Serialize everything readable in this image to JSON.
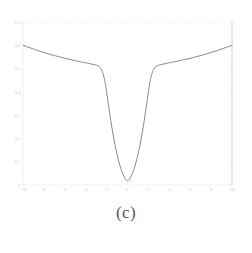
{
  "figure": {
    "caption": "(c)",
    "background_color": "#ffffff",
    "curve_color": "#6b6b6b",
    "axis_color": "#d8d8d8",
    "tick_label_color": "#c9c9c9"
  },
  "chart_data": {
    "type": "line",
    "title": "",
    "subtitle": "",
    "xlabel": "",
    "ylabel": "",
    "xlim": [
      -10,
      10
    ],
    "ylim": [
      0.0,
      0.7
    ],
    "grid": false,
    "legend": null,
    "legend_position": "none",
    "x_ticks": [
      -10,
      -8,
      -6,
      -4,
      -2,
      0,
      2,
      4,
      6,
      8,
      10
    ],
    "x_tick_labels": [
      "-10",
      "-8",
      "-6",
      "-4",
      "-2",
      "0",
      "2",
      "4",
      "6",
      "8",
      "10"
    ],
    "y_ticks": [
      0.0,
      0.1,
      0.2,
      0.3,
      0.4,
      0.5,
      0.6,
      0.7
    ],
    "y_tick_labels": [
      "0",
      "0.1",
      "0.2",
      "0.3",
      "0.4",
      "0.5",
      "0.6",
      "0.7"
    ],
    "series": [
      {
        "name": "curve",
        "x": [
          -10.0,
          -9.5,
          -9.0,
          -8.5,
          -8.0,
          -7.5,
          -7.0,
          -6.5,
          -6.0,
          -5.5,
          -5.0,
          -4.5,
          -4.0,
          -3.8,
          -3.6,
          -3.4,
          -3.2,
          -3.0,
          -2.9,
          -2.8,
          -2.7,
          -2.6,
          -2.5,
          -2.4,
          -2.3,
          -2.2,
          -2.1,
          -2.0,
          -1.8,
          -1.6,
          -1.4,
          -1.2,
          -1.0,
          -0.8,
          -0.6,
          -0.4,
          -0.2,
          0.0,
          0.2,
          0.4,
          0.6,
          0.8,
          1.0,
          1.2,
          1.4,
          1.6,
          1.8,
          2.0,
          2.1,
          2.2,
          2.3,
          2.4,
          2.5,
          2.6,
          2.7,
          2.8,
          2.9,
          3.0,
          3.2,
          3.4,
          3.6,
          3.8,
          4.0,
          4.5,
          5.0,
          5.5,
          6.0,
          6.5,
          7.0,
          7.5,
          8.0,
          8.5,
          9.0,
          9.5,
          10.0
        ],
        "y": [
          0.6,
          0.592,
          0.584,
          0.576,
          0.569,
          0.562,
          0.556,
          0.55,
          0.544,
          0.539,
          0.534,
          0.529,
          0.525,
          0.523,
          0.521,
          0.519,
          0.517,
          0.515,
          0.513,
          0.511,
          0.508,
          0.503,
          0.496,
          0.486,
          0.472,
          0.453,
          0.429,
          0.4,
          0.337,
          0.277,
          0.222,
          0.173,
          0.131,
          0.095,
          0.066,
          0.043,
          0.026,
          0.018,
          0.026,
          0.043,
          0.066,
          0.095,
          0.131,
          0.173,
          0.222,
          0.277,
          0.337,
          0.4,
          0.429,
          0.453,
          0.472,
          0.486,
          0.496,
          0.503,
          0.508,
          0.511,
          0.513,
          0.515,
          0.517,
          0.519,
          0.521,
          0.523,
          0.525,
          0.529,
          0.534,
          0.539,
          0.544,
          0.55,
          0.556,
          0.562,
          0.569,
          0.576,
          0.584,
          0.592,
          0.6
        ],
        "color": "#6b6b6b",
        "style": "solid",
        "width": 0.8
      }
    ],
    "annotations": []
  }
}
